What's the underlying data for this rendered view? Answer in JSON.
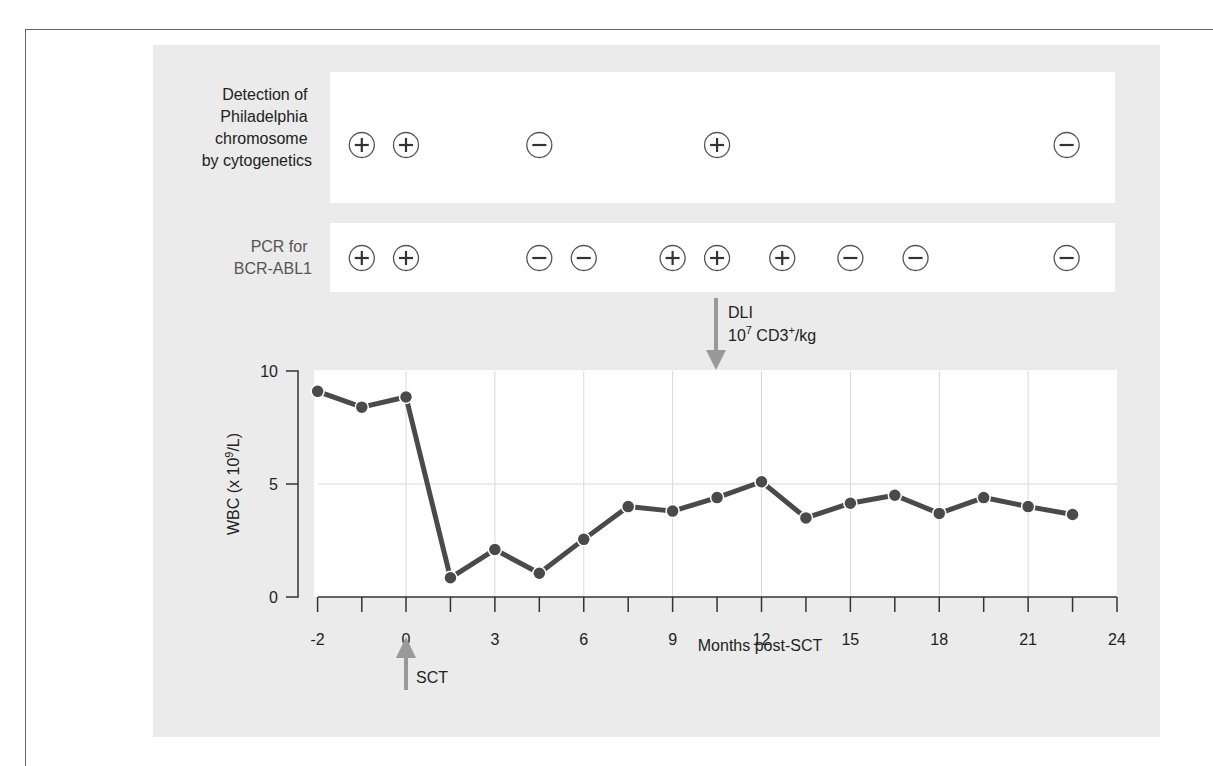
{
  "figure": {
    "row1_label": [
      "Detection of",
      "Philadelphia",
      "chromosome",
      "by cytogenetics"
    ],
    "row2_label": [
      "PCR for",
      "BCR-ABL1"
    ],
    "row1_results": [
      {
        "month": -1,
        "result": "+"
      },
      {
        "month": 0,
        "result": "+"
      },
      {
        "month": 4.5,
        "result": "-"
      },
      {
        "month": 10.5,
        "result": "+"
      },
      {
        "month": 22.3,
        "result": "-"
      }
    ],
    "row2_results": [
      {
        "month": -1,
        "result": "+"
      },
      {
        "month": 0,
        "result": "+"
      },
      {
        "month": 4.5,
        "result": "-"
      },
      {
        "month": 6,
        "result": "-"
      },
      {
        "month": 9,
        "result": "+"
      },
      {
        "month": 10.5,
        "result": "+"
      },
      {
        "month": 12.7,
        "result": "+"
      },
      {
        "month": 15,
        "result": "-"
      },
      {
        "month": 17.2,
        "result": "-"
      },
      {
        "month": 22.3,
        "result": "-"
      }
    ],
    "dli_annotation": {
      "line1": "DLI",
      "line2_base": "10",
      "line2_exp": "7",
      "line2_mid": " CD3",
      "line2_sup": "+",
      "line2_end": "/kg",
      "month": 10.5
    },
    "sct_annotation": {
      "label": "SCT",
      "month": 0
    },
    "colors": {
      "line": "#4a4a4a",
      "arrow": "#999999",
      "panel": "#ebebeb",
      "grid": "#d8d8d8"
    }
  },
  "chart_data": {
    "type": "line",
    "title": "",
    "xlabel": "Months post-SCT",
    "ylabel": "WBC (x 10^9/L)",
    "ylim": [
      0,
      10
    ],
    "xlim": [
      -2,
      24
    ],
    "x_ticks": [
      -2,
      0,
      3,
      6,
      9,
      12,
      15,
      18,
      21,
      24
    ],
    "y_ticks": [
      0,
      5,
      10
    ],
    "grid": true,
    "series": [
      {
        "name": "WBC",
        "x": [
          -2,
          -1,
          0,
          1.5,
          3,
          4.5,
          6,
          7.5,
          9,
          10.5,
          12,
          13.5,
          15,
          16.5,
          18,
          19.5,
          21,
          22.5
        ],
        "values": [
          9.1,
          8.4,
          8.85,
          0.85,
          2.1,
          1.05,
          2.55,
          4.0,
          3.8,
          4.4,
          5.1,
          3.5,
          4.15,
          4.5,
          3.7,
          4.4,
          4.0,
          3.65
        ]
      }
    ],
    "annotations": [
      "SCT at month 0",
      "DLI 10^7 CD3+/kg at month 10.5"
    ]
  }
}
